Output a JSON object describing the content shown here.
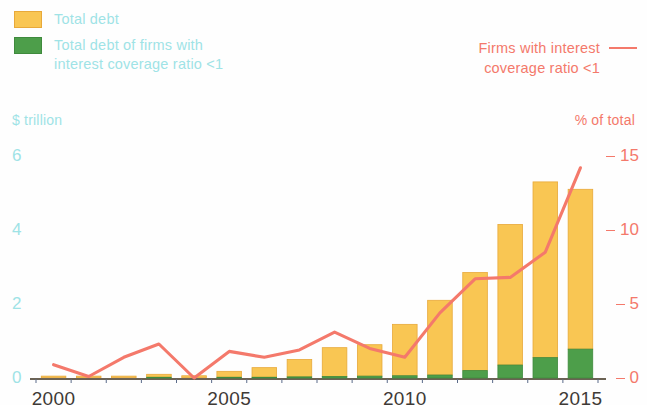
{
  "legend": {
    "left": [
      {
        "label": "Total debt",
        "color": "#f9c653",
        "key": "total-debt"
      },
      {
        "label": "Total debt  of firms with\ninterest coverage ratio <1",
        "color": "#4d9e4a",
        "key": "icr-debt"
      }
    ],
    "left_items": [
      {
        "line1": "Total debt",
        "line2": ""
      },
      {
        "line1": "Total debt  of firms with",
        "line2": "interest coverage ratio <1"
      }
    ],
    "right": {
      "line1": "Firms with interest",
      "line2": "coverage ratio <1",
      "color": "#f4796b"
    }
  },
  "axes": {
    "left_title": "$ trillion",
    "right_title": "% of total",
    "left_ticks": [
      "0",
      "2",
      "4",
      "6"
    ],
    "right_ticks": [
      "0",
      "5",
      "10",
      "15"
    ],
    "x_ticks": [
      "2000",
      "2005",
      "2010",
      "2015"
    ]
  },
  "chart_data": {
    "type": "bar",
    "title": "",
    "subtitle": "",
    "xlabel": "",
    "ylabel": "$ trillion",
    "y2label": "% of total",
    "ylim": [
      0,
      6.6
    ],
    "y2lim": [
      0,
      16.5
    ],
    "grid": false,
    "legend_position": "top",
    "categories": [
      "2000",
      "2001",
      "2002",
      "2003",
      "2004",
      "2005",
      "2006",
      "2007",
      "2008",
      "2009",
      "2010",
      "2011",
      "2012",
      "2013",
      "2014",
      "2015"
    ],
    "series": [
      {
        "name": "Total debt",
        "type": "bar",
        "stack": "debt",
        "axis": "left",
        "unit": "$ trillion",
        "color": "#f9c653",
        "values": [
          0.03,
          0.04,
          0.05,
          0.1,
          0.06,
          0.18,
          0.28,
          0.5,
          0.82,
          0.9,
          1.45,
          2.1,
          2.85,
          4.15,
          5.3,
          5.1
        ]
      },
      {
        "name": "Total debt of firms with interest coverage ratio <1",
        "type": "bar",
        "stack": "debt",
        "axis": "left",
        "unit": "$ trillion",
        "color": "#4d9e4a",
        "values": [
          0.01,
          0.01,
          0.01,
          0.02,
          0.01,
          0.02,
          0.02,
          0.03,
          0.04,
          0.05,
          0.06,
          0.08,
          0.2,
          0.35,
          0.55,
          0.78
        ]
      },
      {
        "name": "Firms with interest coverage ratio <1",
        "type": "line",
        "axis": "right",
        "unit": "% of total",
        "color": "#f4796b",
        "values": [
          0.9,
          0.1,
          1.4,
          2.3,
          0.0,
          1.8,
          1.4,
          1.9,
          3.1,
          2.0,
          1.4,
          4.4,
          6.7,
          6.8,
          8.5,
          14.2
        ]
      }
    ]
  },
  "colors": {
    "bar_total": "#f9c653",
    "bar_total_edge": "#e8a93a",
    "bar_icr": "#4d9e4a",
    "bar_icr_edge": "#3f8a3d",
    "line": "#f4796b",
    "left_axis_text": "#9fe3e6",
    "right_axis_text": "#f4796b",
    "x_axis_text": "#3e3a36",
    "baseline": "#6b6254"
  }
}
